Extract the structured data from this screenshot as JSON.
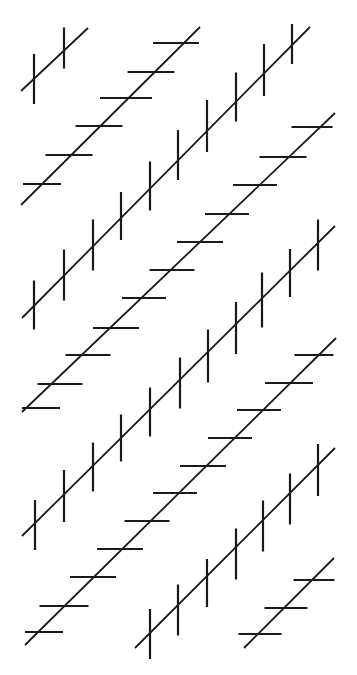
{
  "figure": {
    "title": "Zöllner illusion",
    "stroke_color": "#1a1a1a",
    "background_color": "#ffffff",
    "main_stroke_width": 1.8,
    "tick_stroke_width": 2.2,
    "lines": [
      {
        "id": "line-a",
        "tick_orientation": "vertical",
        "start": [
          21,
          91
        ],
        "end": [
          88,
          28
        ],
        "ticks": [
          {
            "c": [
              34,
              79
            ],
            "len": 50
          },
          {
            "c": [
              64,
              48
            ],
            "len": 41
          }
        ]
      },
      {
        "id": "line-b",
        "tick_orientation": "horizontal",
        "start": [
          21,
          205
        ],
        "end": [
          200,
          27
        ],
        "ticks": [
          {
            "c": [
              176,
              43
            ],
            "len": 46
          },
          {
            "c": [
              151,
              72
            ],
            "len": 47
          },
          {
            "c": [
              126,
              98
            ],
            "len": 52
          },
          {
            "c": [
              99,
              126
            ],
            "len": 47
          },
          {
            "c": [
              69,
              155
            ],
            "len": 47
          },
          {
            "c": [
              42,
              184
            ],
            "len": 38
          }
        ]
      },
      {
        "id": "line-c",
        "tick_orientation": "vertical",
        "start": [
          22,
          318
        ],
        "end": [
          310,
          27
        ],
        "ticks": [
          {
            "c": [
              34,
              305
            ],
            "len": 49
          },
          {
            "c": [
              64,
              275
            ],
            "len": 51
          },
          {
            "c": [
              93,
              245
            ],
            "len": 51
          },
          {
            "c": [
              121,
              216
            ],
            "len": 48
          },
          {
            "c": [
              150,
              186
            ],
            "len": 49
          },
          {
            "c": [
              178,
              155
            ],
            "len": 50
          },
          {
            "c": [
              207,
              126
            ],
            "len": 52
          },
          {
            "c": [
              236,
              97
            ],
            "len": 49
          },
          {
            "c": [
              264,
              70
            ],
            "len": 52
          },
          {
            "c": [
              292,
              44
            ],
            "len": 40
          }
        ]
      },
      {
        "id": "line-d",
        "tick_orientation": "horizontal",
        "start": [
          22,
          412
        ],
        "end": [
          335,
          113
        ],
        "ticks": [
          {
            "c": [
              312,
              127
            ],
            "len": 41
          },
          {
            "c": [
              283,
              157
            ],
            "len": 47
          },
          {
            "c": [
              255,
              185
            ],
            "len": 44
          },
          {
            "c": [
              227,
              214
            ],
            "len": 44
          },
          {
            "c": [
              200,
              242
            ],
            "len": 46
          },
          {
            "c": [
              172,
              270
            ],
            "len": 45
          },
          {
            "c": [
              144,
              298
            ],
            "len": 44
          },
          {
            "c": [
              116,
              328
            ],
            "len": 46
          },
          {
            "c": [
              88,
              355
            ],
            "len": 45
          },
          {
            "c": [
              60,
              384
            ],
            "len": 45
          },
          {
            "c": [
              41,
              408
            ],
            "len": 38
          }
        ]
      },
      {
        "id": "line-e",
        "tick_orientation": "vertical",
        "start": [
          22,
          536
        ],
        "end": [
          335,
          226
        ],
        "ticks": [
          {
            "c": [
              35,
              525
            ],
            "len": 50
          },
          {
            "c": [
              64,
              496
            ],
            "len": 52
          },
          {
            "c": [
              93,
              467
            ],
            "len": 49
          },
          {
            "c": [
              121,
              438
            ],
            "len": 47
          },
          {
            "c": [
              150,
              412
            ],
            "len": 49
          },
          {
            "c": [
              180,
              383
            ],
            "len": 51
          },
          {
            "c": [
              208,
              356
            ],
            "len": 53
          },
          {
            "c": [
              236,
              328
            ],
            "len": 52
          },
          {
            "c": [
              262,
              300
            ],
            "len": 55
          },
          {
            "c": [
              290,
              273
            ],
            "len": 48
          },
          {
            "c": [
              318,
              245
            ],
            "len": 51
          }
        ]
      },
      {
        "id": "line-f",
        "tick_orientation": "horizontal",
        "start": [
          25,
          645
        ],
        "end": [
          336,
          338
        ],
        "ticks": [
          {
            "c": [
              314,
              355
            ],
            "len": 39
          },
          {
            "c": [
              289,
              383
            ],
            "len": 48
          },
          {
            "c": [
              259,
              410
            ],
            "len": 44
          },
          {
            "c": [
              230,
              438
            ],
            "len": 44
          },
          {
            "c": [
              203,
              466
            ],
            "len": 46
          },
          {
            "c": [
              175,
              493
            ],
            "len": 44
          },
          {
            "c": [
              147,
              521
            ],
            "len": 45
          },
          {
            "c": [
              120,
              549
            ],
            "len": 46
          },
          {
            "c": [
              93,
              577
            ],
            "len": 46
          },
          {
            "c": [
              64,
              606
            ],
            "len": 49
          },
          {
            "c": [
              44,
              632
            ],
            "len": 38
          }
        ]
      },
      {
        "id": "line-g",
        "tick_orientation": "vertical",
        "start": [
          135,
          648
        ],
        "end": [
          335,
          448
        ],
        "ticks": [
          {
            "c": [
              150,
              634
            ],
            "len": 50
          },
          {
            "c": [
              178,
              610
            ],
            "len": 51
          },
          {
            "c": [
              207,
              583
            ],
            "len": 48
          },
          {
            "c": [
              236,
              554
            ],
            "len": 51
          },
          {
            "c": [
              263,
              526
            ],
            "len": 51
          },
          {
            "c": [
              290,
              499
            ],
            "len": 51
          },
          {
            "c": [
              318,
              470
            ],
            "len": 52
          }
        ]
      },
      {
        "id": "line-h",
        "tick_orientation": "horizontal",
        "start": [
          244,
          648
        ],
        "end": [
          334,
          558
        ],
        "ticks": [
          {
            "c": [
              314,
              580
            ],
            "len": 41
          },
          {
            "c": [
              286,
              608
            ],
            "len": 43
          },
          {
            "c": [
              260,
              634
            ],
            "len": 43
          }
        ]
      }
    ]
  }
}
